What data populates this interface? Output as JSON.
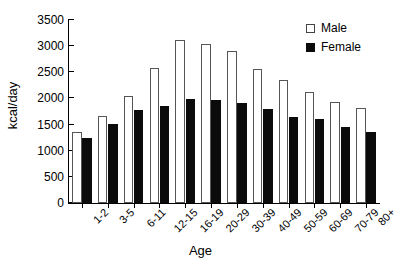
{
  "chart_data": {
    "type": "bar",
    "title": "",
    "xlabel": "Age",
    "ylabel": "kcal/day",
    "ylim": [
      0,
      3500
    ],
    "yticks": [
      0,
      500,
      1000,
      1500,
      2000,
      2500,
      3000,
      3500
    ],
    "grid": false,
    "legend_position": "top-right",
    "categories": [
      "1-2",
      "3-5",
      "6-11",
      "12-15",
      "16-19",
      "20-29",
      "30-39",
      "40-49",
      "50-59",
      "60-69",
      "70-79",
      "80+"
    ],
    "series": [
      {
        "name": "Male",
        "color": "#ffffff",
        "values": [
          1350,
          1670,
          2040,
          2590,
          3110,
          3050,
          2910,
          2570,
          2350,
          2130,
          1930,
          1820
        ]
      },
      {
        "name": "Female",
        "color": "#0b0b0b",
        "values": [
          1240,
          1520,
          1770,
          1860,
          1980,
          1970,
          1910,
          1790,
          1650,
          1610,
          1460,
          1350
        ]
      }
    ]
  },
  "legend": {
    "entries": [
      {
        "label": "Male"
      },
      {
        "label": "Female"
      }
    ]
  }
}
